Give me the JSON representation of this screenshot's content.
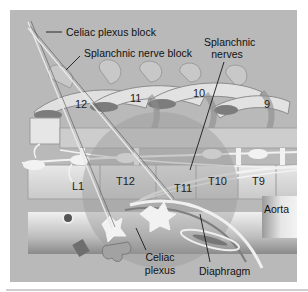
{
  "figure": {
    "type": "anatomical-illustration",
    "background_color": "#b9b9b9",
    "colors": {
      "bone_light": "#e3e3e3",
      "bone_mid": "#cdcdcd",
      "bone_dark": "#8f8f8f",
      "rib_shadow": "#7c7c7c",
      "nerve": "#f2f2f2",
      "shading_circle": "#a7a7a7",
      "line": "#1a1a1a"
    }
  },
  "labels": {
    "celiac_plexus_block": "Celiac plexus block",
    "splanchnic_nerve_block": "Splanchnic nerve block",
    "splanchnic_nerves_line1": "Splanchnic",
    "splanchnic_nerves_line2": "nerves",
    "aorta": "Aorta",
    "celiac_plexus_line1": "Celiac",
    "celiac_plexus_line2": "plexus",
    "diaphragm": "Diaphragm"
  },
  "ribs": [
    {
      "label": "12"
    },
    {
      "label": "11"
    },
    {
      "label": "10"
    },
    {
      "label": "9"
    }
  ],
  "vertebrae": [
    {
      "label": "L1"
    },
    {
      "label": "T12"
    },
    {
      "label": "T11"
    },
    {
      "label": "T10"
    },
    {
      "label": "T9"
    }
  ]
}
